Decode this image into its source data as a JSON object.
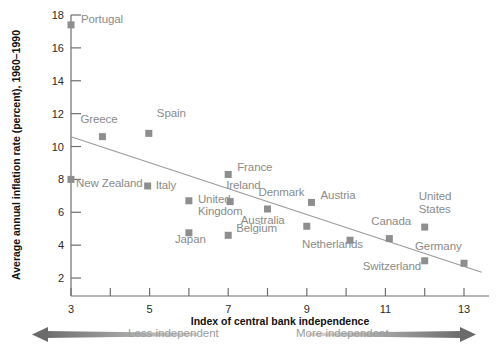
{
  "chart_data": {
    "type": "scatter",
    "title": "",
    "xlabel": "Index of central bank independence",
    "ylabel": "Average annual inflation rate (percent), 1960–1990",
    "xlim": [
      3,
      13.45
    ],
    "ylim": [
      0.9,
      18
    ],
    "xticks": [
      3,
      4,
      5,
      6,
      7,
      8,
      9,
      10,
      11,
      12,
      13
    ],
    "xtick_labels": [
      "3",
      "",
      "5",
      "",
      "7",
      "",
      "9",
      "",
      "11",
      "",
      "13"
    ],
    "yticks": [
      2,
      4,
      6,
      8,
      10,
      12,
      14,
      16,
      18
    ],
    "ytick_labels": [
      "2",
      "4",
      "6",
      "8",
      "10",
      "12",
      "14",
      "16",
      "18"
    ],
    "grid": false,
    "legend": "none",
    "marker_color": "#8e8e8e",
    "label_color": "#8b8b8b",
    "trend_color": "#9a9a9a",
    "axis_color": "#6f6f6f",
    "points": [
      {
        "name": "Portugal",
        "x": 3.0,
        "y": 17.4,
        "label_dx": 10,
        "label_dy": -6,
        "align": "left"
      },
      {
        "name": "Greece",
        "x": 3.8,
        "y": 10.6,
        "label_dx": -22,
        "label_dy": -18,
        "align": "left"
      },
      {
        "name": "Spain",
        "x": 4.98,
        "y": 10.8,
        "label_dx": 8,
        "label_dy": -20,
        "align": "left"
      },
      {
        "name": "New Zealand",
        "x": 3.0,
        "y": 8.0,
        "label_dx": 5,
        "label_dy": 4,
        "align": "left"
      },
      {
        "name": "Italy",
        "x": 4.95,
        "y": 7.6,
        "label_dx": 8,
        "label_dy": -1,
        "align": "left"
      },
      {
        "name": "France",
        "x": 7.0,
        "y": 8.3,
        "label_dx": 9,
        "label_dy": -7,
        "align": "left"
      },
      {
        "name": "Ireland",
        "x": 7.05,
        "y": 6.65,
        "label_dx": -4,
        "label_dy": -17,
        "align": "left"
      },
      {
        "name": "United\nKingdom",
        "x": 6.0,
        "y": 6.7,
        "label_dx": 9,
        "label_dy": -2,
        "align": "left"
      },
      {
        "name": "Denmark",
        "x": 8.0,
        "y": 6.2,
        "label_dx": -9,
        "label_dy": -17,
        "align": "left"
      },
      {
        "name": "Austria",
        "x": 9.12,
        "y": 6.6,
        "label_dx": 9,
        "label_dy": -7,
        "align": "left"
      },
      {
        "name": "Australia",
        "x": 9.0,
        "y": 5.15,
        "label_dx": -66,
        "label_dy": -6,
        "align": "left"
      },
      {
        "name": "Japan",
        "x": 6.0,
        "y": 4.75,
        "label_dx": -14,
        "label_dy": 6,
        "align": "left"
      },
      {
        "name": "Belgium",
        "x": 7.0,
        "y": 4.6,
        "label_dx": 8,
        "label_dy": -7,
        "align": "left"
      },
      {
        "name": "Netherlands",
        "x": 10.1,
        "y": 4.3,
        "label_dx": -48,
        "label_dy": 4,
        "align": "left"
      },
      {
        "name": "Canada",
        "x": 11.1,
        "y": 4.4,
        "label_dx": -18,
        "label_dy": -18,
        "align": "left"
      },
      {
        "name": "United\nStates",
        "x": 12.0,
        "y": 5.1,
        "label_dx": -6,
        "label_dy": -31,
        "align": "left"
      },
      {
        "name": "Germany",
        "x": 13.0,
        "y": 2.9,
        "label_dx": -49,
        "label_dy": -17,
        "align": "left"
      },
      {
        "name": "Switzerland",
        "x": 12.0,
        "y": 3.05,
        "label_dx": -62,
        "label_dy": 5,
        "align": "left"
      }
    ],
    "trend": {
      "x1": 3.0,
      "y1": 10.6,
      "x2": 13.45,
      "y2": 2.35
    }
  },
  "footer": {
    "less_independent": "Less independent",
    "more_independent": "More independent"
  }
}
